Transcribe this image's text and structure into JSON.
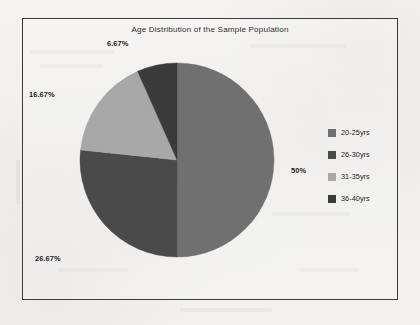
{
  "chart_data": {
    "type": "pie",
    "title": "Age Distribution of the Sample Population",
    "xlabel": "",
    "ylabel": "",
    "legend_position": "right",
    "grid": false,
    "categories": [
      "20-25yrs",
      "26-30yrs",
      "31-35yrs",
      "36-40yrs"
    ],
    "values": [
      50,
      26.67,
      16.67,
      6.67
    ],
    "value_labels": [
      "50%",
      "26.67%",
      "16.67%",
      "6.67%"
    ],
    "colors": [
      "#707070",
      "#4a4a4a",
      "#a8a8a8",
      "#3a3a3a"
    ],
    "start_angle_deg": 0,
    "direction": "clockwise",
    "slices": [
      {
        "label": "20-25yrs",
        "value": 50,
        "display": "50%",
        "color": "#707070"
      },
      {
        "label": "26-30yrs",
        "value": 26.67,
        "display": "26.67%",
        "color": "#4a4a4a"
      },
      {
        "label": "31-35yrs",
        "value": 16.67,
        "display": "16.67%",
        "color": "#a8a8a8"
      },
      {
        "label": "36-40yrs",
        "value": 6.67,
        "display": "6.67%",
        "color": "#3a3a3a"
      }
    ]
  },
  "frame": {
    "border_color": "#3b3b3b"
  },
  "legend": {
    "items": [
      {
        "label": "20-25yrs",
        "color": "#707070"
      },
      {
        "label": "26-30yrs",
        "color": "#4a4a4a"
      },
      {
        "label": "31-35yrs",
        "color": "#a8a8a8"
      },
      {
        "label": "36-40yrs",
        "color": "#3a3a3a"
      }
    ]
  }
}
